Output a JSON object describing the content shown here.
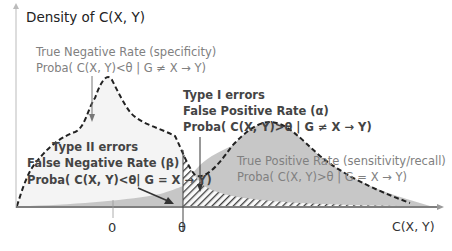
{
  "diagram": {
    "y_axis_label": "Density of C(X, Y)",
    "x_axis_label": "C(X, Y)",
    "ticks": {
      "zero": "0",
      "theta": "θ"
    },
    "tnr": {
      "line1": "True Negative Rate (specificity)",
      "line2": "Proba( C(X, Y)<θ  |  G ≠ X → Y)"
    },
    "type1": {
      "line1": "Type I errors",
      "line2": "False Positive Rate (α)",
      "line3": "Proba( C(X, Y)>θ  |  G ≠ X → Y)"
    },
    "type2": {
      "line1": "Type II errors",
      "line2": "False Negative Rate (β)",
      "line3": "Proba( C(X, Y)<θ|  G = X → Y)"
    },
    "tpr": {
      "line1": "True Positive Rate (sensitivity/recall)",
      "line2": "Proba( C(X, Y)>θ  |  G = X → Y)"
    },
    "colors": {
      "negative_fill": "#f4f4f4",
      "positive_fill": "#bdbdbd",
      "hatch": "#333333",
      "axis": "#555555",
      "dashed_outline": "#222222"
    }
  }
}
